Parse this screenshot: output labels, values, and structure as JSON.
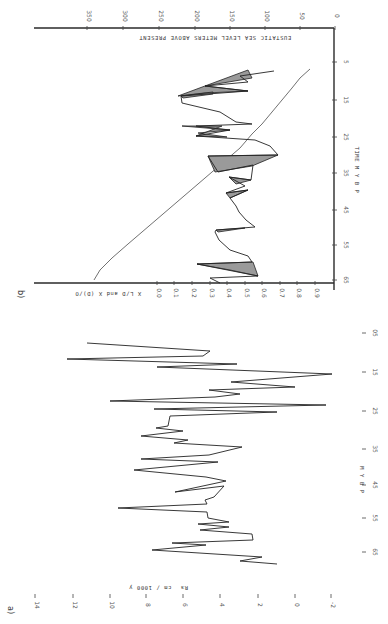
{
  "figure": {
    "orientation": "rotated 90 degrees (landscape figure on portrait page)"
  },
  "chart_data": [
    {
      "panel": "a",
      "type": "line",
      "title": "",
      "xlabel": "M Y B P",
      "ylabel": "R_s  cm / 1000 y",
      "x_ticks": [
        "05",
        "15",
        "25",
        "35",
        "45",
        "55",
        "65"
      ],
      "y_ticks": [
        "14",
        "12",
        "10",
        "8",
        "6",
        "4",
        "2",
        "0",
        "-2"
      ],
      "xlim": [
        65,
        5
      ],
      "ylim": [
        -2,
        14
      ],
      "series": [
        {
          "name": "R_s sedimentation rate",
          "x": [
            7,
            8,
            9,
            10,
            11,
            12,
            13,
            14,
            15,
            16,
            17,
            18,
            19,
            20,
            21,
            22,
            23,
            24,
            25,
            26,
            27,
            28,
            29,
            30,
            31,
            32,
            33,
            34,
            35,
            36,
            37,
            38,
            39,
            40,
            41,
            42,
            43,
            44,
            45,
            46,
            47,
            48,
            49,
            50,
            51,
            52,
            53,
            54,
            55,
            56,
            57,
            58,
            59,
            60,
            61,
            62,
            63
          ],
          "y": [
            12.6,
            3.4,
            13.8,
            6.6,
            1.8,
            8.7,
            -1.6,
            4.9,
            0.9,
            3.0,
            6.1,
            2.2,
            10.6,
            1.3,
            8.3,
            0.9,
            4.6,
            5.7,
            7.2,
            4.8,
            7.4,
            5.0,
            6.9,
            1.8,
            3.7,
            7.5,
            4.2,
            7.1,
            8.0,
            3.7,
            3.1,
            6.0,
            2.8,
            2.7,
            3.0,
            9.2,
            2.8,
            2.6,
            4.0,
            2.4,
            3.3,
            1.0,
            3.8,
            2.0,
            6.4,
            2.8,
            1.5,
            4.3,
            1.9,
            4.3,
            5.5,
            2.4,
            1.4,
            1.6,
            1.2,
            4.1,
            1.7
          ]
        }
      ]
    },
    {
      "panel": "b",
      "type": "line",
      "title": "",
      "xlabel": "TIME  M Y B P",
      "ylabel_left": "X L/D and X (D)/O",
      "ylabel_right": "EUSTATIC SEA LEVEL METERS ABOVE PRESENT",
      "x_ticks": [
        "5",
        "15",
        "25",
        "35",
        "45",
        "55",
        "65"
      ],
      "y_left_ticks": [
        "0.0",
        "0.1",
        "0.2",
        "0.3",
        "0.4",
        "0.5",
        "0.6",
        "0.7",
        "0.8",
        "0.9"
      ],
      "y_right_ticks": [
        "350",
        "300",
        "250",
        "200",
        "150",
        "100",
        "50",
        "0"
      ],
      "xlim": [
        65,
        0
      ],
      "ylim_left": [
        0.0,
        0.9
      ],
      "ylim_right": [
        0,
        350
      ],
      "series": [
        {
          "name": "Eustatic sea level (m above present)",
          "x": [
            6,
            10,
            15,
            20,
            25,
            30,
            35,
            40,
            45,
            50,
            55,
            60,
            65
          ],
          "y": [
            30,
            60,
            95,
            110,
            140,
            175,
            195,
            215,
            240,
            260,
            285,
            300,
            320
          ]
        },
        {
          "name": "D/L ratio envelope (shaded)",
          "x": [
            8,
            10,
            12,
            14,
            18,
            20,
            22,
            24,
            28,
            30,
            32,
            34,
            36,
            38,
            40,
            42,
            46,
            48,
            52,
            56,
            58,
            62,
            64
          ],
          "y": [
            0.6,
            0.42,
            0.52,
            0.34,
            0.72,
            0.52,
            0.68,
            0.55,
            0.82,
            0.62,
            0.75,
            0.72,
            0.58,
            0.7,
            0.52,
            0.62,
            0.5,
            0.6,
            0.45,
            0.55,
            0.52,
            0.4,
            0.6
          ]
        }
      ]
    }
  ],
  "panel_a": {
    "label": "a)",
    "ylabel_units": "cm / 1000 y",
    "ylabel_symbol": "Rs",
    "xlabel": "M Y B P",
    "y_ticks": [
      {
        "label": "14",
        "x": 35
      },
      {
        "label": "12",
        "x": 73
      },
      {
        "label": "10",
        "x": 110
      },
      {
        "label": "8",
        "x": 146
      },
      {
        "label": "6",
        "x": 183
      },
      {
        "label": "4",
        "x": 220
      },
      {
        "label": "2",
        "x": 258
      },
      {
        "label": "0",
        "x": 295
      },
      {
        "label": "-2",
        "x": 331
      }
    ],
    "x_ticks": [
      {
        "label": "05",
        "y": 333
      },
      {
        "label": "15",
        "y": 372
      },
      {
        "label": "25",
        "y": 411
      },
      {
        "label": "35",
        "y": 449
      },
      {
        "label": "45",
        "y": 485
      },
      {
        "label": "55",
        "y": 518
      },
      {
        "label": "65",
        "y": 552
      }
    ]
  },
  "panel_b": {
    "label": "b)",
    "sea_level_label": "EUSTATIC SEA LEVEL METERS ABOVE PRESENT",
    "dl_label": "X L/D and X (D)/O",
    "time_label": "TIME  M Y B P",
    "sea_level_ticks": [
      {
        "label": "350",
        "x": 87
      },
      {
        "label": "300",
        "x": 123
      },
      {
        "label": "250",
        "x": 159
      },
      {
        "label": "200",
        "x": 195
      },
      {
        "label": "150",
        "x": 230
      },
      {
        "label": "100",
        "x": 265
      },
      {
        "label": "50",
        "x": 300
      },
      {
        "label": "0",
        "x": 335
      }
    ],
    "dl_ticks": [
      {
        "label": "0.0",
        "x": 157
      },
      {
        "label": "0.1",
        "x": 174
      },
      {
        "label": "0.2",
        "x": 192
      },
      {
        "label": "0.3",
        "x": 210
      },
      {
        "label": "0.4",
        "x": 227
      },
      {
        "label": "0.5",
        "x": 245
      },
      {
        "label": "0.6",
        "x": 262
      },
      {
        "label": "0.7",
        "x": 280
      },
      {
        "label": "0.8",
        "x": 297
      },
      {
        "label": "0.9",
        "x": 315
      }
    ],
    "time_ticks": [
      {
        "label": "5",
        "y": 62
      },
      {
        "label": "15",
        "y": 100
      },
      {
        "label": "25",
        "y": 137
      },
      {
        "label": "35",
        "y": 173
      },
      {
        "label": "45",
        "y": 210
      },
      {
        "label": "55",
        "y": 245
      },
      {
        "label": "65",
        "y": 280
      }
    ]
  }
}
